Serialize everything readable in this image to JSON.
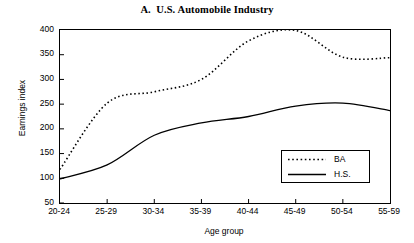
{
  "chart_data": {
    "type": "line",
    "title": "A.  U.S. Automobile Industry",
    "xlabel": "Age group",
    "ylabel": "Earnings index",
    "categories": [
      "20-24",
      "25-29",
      "30-34",
      "35-39",
      "40-44",
      "45-49",
      "50-54",
      "55-59"
    ],
    "ylim": [
      50,
      400
    ],
    "yticks": [
      50,
      100,
      150,
      200,
      250,
      300,
      350,
      400
    ],
    "ytick_labels": [
      "50",
      "100",
      "150",
      "200",
      "250",
      "300",
      "350",
      "400"
    ],
    "grid": false,
    "legend_position": "lower right",
    "series": [
      {
        "name": "BA",
        "style": "dotted",
        "color": "#000000",
        "values": [
          118,
          252,
          275,
          300,
          378,
          399,
          345,
          344
        ]
      },
      {
        "name": "H.S.",
        "style": "solid",
        "color": "#000000",
        "values": [
          99,
          127,
          187,
          212,
          225,
          246,
          252,
          237
        ]
      }
    ]
  },
  "legend": {
    "entries": [
      {
        "label": "BA"
      },
      {
        "label": "H.S."
      }
    ]
  }
}
